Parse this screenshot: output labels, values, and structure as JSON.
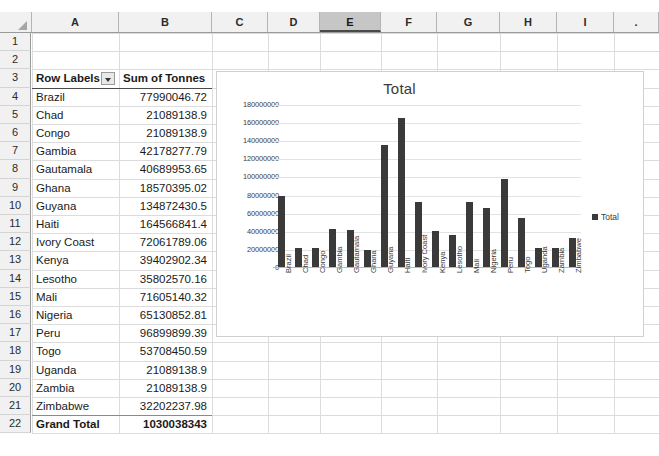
{
  "spreadsheet": {
    "column_headers": [
      "A",
      "B",
      "C",
      "D",
      "E",
      "F",
      "G",
      "H",
      "I"
    ],
    "selected_column": "E",
    "row_numbers": [
      "1",
      "2",
      "3",
      "4",
      "5",
      "6",
      "7",
      "8",
      "9",
      "10",
      "11",
      "12",
      "13",
      "14",
      "15",
      "16",
      "17",
      "18",
      "19",
      "20",
      "21",
      "22"
    ],
    "header_row": {
      "row": "3",
      "row_labels": "Row Labels",
      "sum_of_tonnes": "Sum of Tonnes",
      "filter_icon": "filter-dropdown-icon"
    },
    "rows": [
      {
        "row": "4",
        "label": "Brazil",
        "value": "77990046.72"
      },
      {
        "row": "5",
        "label": "Chad",
        "value": "21089138.9"
      },
      {
        "row": "6",
        "label": "Congo",
        "value": "21089138.9"
      },
      {
        "row": "7",
        "label": "Gambia",
        "value": "42178277.79"
      },
      {
        "row": "8",
        "label": "Gautamala",
        "value": "40689953.65"
      },
      {
        "row": "9",
        "label": "Ghana",
        "value": "18570395.02"
      },
      {
        "row": "10",
        "label": "Guyana",
        "value": "134872430.5"
      },
      {
        "row": "11",
        "label": "Haiti",
        "value": "164566841.4"
      },
      {
        "row": "12",
        "label": "Ivory Coast",
        "value": "72061789.06"
      },
      {
        "row": "13",
        "label": "Kenya",
        "value": "39402902.34"
      },
      {
        "row": "14",
        "label": "Lesotho",
        "value": "35802570.16"
      },
      {
        "row": "15",
        "label": "Mali",
        "value": "71605140.32"
      },
      {
        "row": "16",
        "label": "Nigeria",
        "value": "65130852.81"
      },
      {
        "row": "17",
        "label": "Peru",
        "value": "96899899.39"
      },
      {
        "row": "18",
        "label": "Togo",
        "value": "53708450.59"
      },
      {
        "row": "19",
        "label": "Uganda",
        "value": "21089138.9"
      },
      {
        "row": "20",
        "label": "Zambia",
        "value": "21089138.9"
      },
      {
        "row": "21",
        "label": "Zimbabwe",
        "value": "32202237.98"
      }
    ],
    "grand_total": {
      "row": "22",
      "label": "Grand Total",
      "value": "1030038343"
    }
  },
  "chart_data": {
    "type": "bar",
    "title": "Total",
    "xlabel": "",
    "ylabel": "",
    "ylim": [
      0,
      180000000
    ],
    "ytick_step": 20000000,
    "ytick_labels": [
      "180000000",
      "160000000",
      "140000000",
      "120000000",
      "100000000",
      "80000000",
      "60000000",
      "40000000",
      "20000000",
      "0"
    ],
    "grid": true,
    "legend_position": "right",
    "series": [
      {
        "name": "Total",
        "color": "#3a3a3a",
        "values": [
          77990046.72,
          21089138.9,
          21089138.9,
          42178277.79,
          40689953.65,
          18570395.02,
          134872430.5,
          164566841.4,
          72061789.06,
          39402902.34,
          35802570.16,
          71605140.32,
          65130852.81,
          96899899.39,
          53708450.59,
          21089138.9,
          21089138.9,
          32202237.98
        ]
      }
    ],
    "categories": [
      "Brazil",
      "Chad",
      "Congo",
      "Gambia",
      "Gautamala",
      "Ghana",
      "Guyana",
      "Haiti",
      "Ivory Coast",
      "Kenya",
      "Lesotho",
      "Mali",
      "Nigeria",
      "Peru",
      "Togo",
      "Uganda",
      "Zambia",
      "Zimbabwe"
    ],
    "legend": [
      "Total"
    ]
  },
  "colors": {
    "bar": "#3a3a3a",
    "gridline": "#e2e2e2",
    "header_fill": "#f1f1f1",
    "selected_header_fill": "#c6c6c6"
  }
}
